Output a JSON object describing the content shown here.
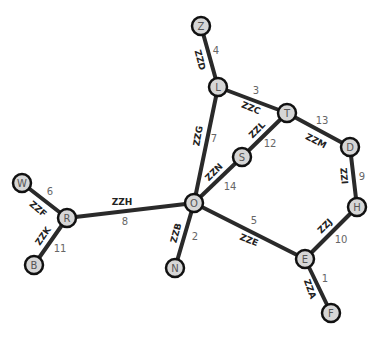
{
  "graph": {
    "nodes": [
      {
        "id": "Z",
        "x": 201,
        "y": 26
      },
      {
        "id": "L",
        "x": 218,
        "y": 87
      },
      {
        "id": "T",
        "x": 287,
        "y": 113
      },
      {
        "id": "D",
        "x": 350,
        "y": 147
      },
      {
        "id": "H",
        "x": 357,
        "y": 207
      },
      {
        "id": "E",
        "x": 305,
        "y": 259
      },
      {
        "id": "F",
        "x": 331,
        "y": 313
      },
      {
        "id": "O",
        "x": 194,
        "y": 203
      },
      {
        "id": "S",
        "x": 242,
        "y": 157
      },
      {
        "id": "R",
        "x": 67,
        "y": 218
      },
      {
        "id": "W",
        "x": 22,
        "y": 183
      },
      {
        "id": "B",
        "x": 34,
        "y": 265
      },
      {
        "id": "N",
        "x": 175,
        "y": 268
      }
    ],
    "edges": [
      {
        "from": "Z",
        "to": "L",
        "label": "ZZD",
        "weight": "4",
        "lx": 200,
        "ly": 60,
        "lr": 75,
        "wx": 216,
        "wy": 50
      },
      {
        "from": "L",
        "to": "T",
        "label": "ZZC",
        "weight": "3",
        "lx": 251,
        "ly": 108,
        "lr": 22,
        "wx": 256,
        "wy": 90
      },
      {
        "from": "T",
        "to": "D",
        "label": "ZZM",
        "weight": "13",
        "lx": 316,
        "ly": 141,
        "lr": 28,
        "wx": 322,
        "wy": 120
      },
      {
        "from": "D",
        "to": "H",
        "label": "ZZI",
        "weight": "9",
        "lx": 344,
        "ly": 176,
        "lr": 85,
        "wx": 362,
        "wy": 176
      },
      {
        "from": "H",
        "to": "E",
        "label": "ZZJ",
        "weight": "10",
        "lx": 325,
        "ly": 226,
        "lr": -45,
        "wx": 341,
        "wy": 239
      },
      {
        "from": "E",
        "to": "F",
        "label": "ZZA",
        "weight": "1",
        "lx": 310,
        "ly": 289,
        "lr": 70,
        "wx": 325,
        "wy": 278
      },
      {
        "from": "O",
        "to": "E",
        "label": "ZZE",
        "weight": "5",
        "lx": 249,
        "ly": 240,
        "lr": 22,
        "wx": 254,
        "wy": 220
      },
      {
        "from": "O",
        "to": "L",
        "label": "ZZG",
        "weight": "7",
        "lx": 198,
        "ly": 136,
        "lr": -80,
        "wx": 214,
        "wy": 138
      },
      {
        "from": "O",
        "to": "S",
        "label": "ZZN",
        "weight": "14",
        "lx": 214,
        "ly": 172,
        "lr": -45,
        "wx": 230,
        "wy": 186
      },
      {
        "from": "S",
        "to": "T",
        "label": "ZZL",
        "weight": "12",
        "lx": 257,
        "ly": 130,
        "lr": -45,
        "wx": 270,
        "wy": 143
      },
      {
        "from": "R",
        "to": "O",
        "label": "ZZH",
        "weight": "8",
        "lx": 122,
        "ly": 202,
        "lr": 0,
        "wx": 125,
        "wy": 221
      },
      {
        "from": "R",
        "to": "W",
        "label": "ZZF",
        "weight": "6",
        "lx": 38,
        "ly": 209,
        "lr": 40,
        "wx": 50,
        "wy": 191
      },
      {
        "from": "R",
        "to": "B",
        "label": "ZZK",
        "weight": "11",
        "lx": 43,
        "ly": 236,
        "lr": -55,
        "wx": 60,
        "wy": 248
      },
      {
        "from": "O",
        "to": "N",
        "label": "ZZB",
        "weight": "2",
        "lx": 176,
        "ly": 233,
        "lr": -75,
        "wx": 195,
        "wy": 236
      }
    ]
  }
}
